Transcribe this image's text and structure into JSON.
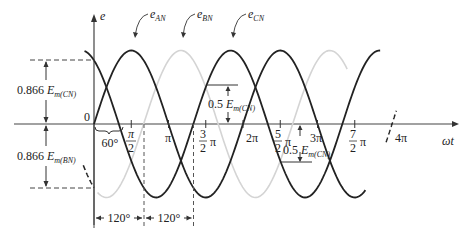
{
  "figure": {
    "y_axis_label": "e",
    "x_axis_label": "ωt",
    "origin_label": "0",
    "curve_labels": {
      "e_AN": {
        "main": "e",
        "sub": "AN"
      },
      "e_BN": {
        "main": "e",
        "sub": "BN"
      },
      "e_CN": {
        "main": "e",
        "sub": "CN"
      }
    },
    "x_ticks": [
      {
        "num": "π",
        "den": "2",
        "frac": true
      },
      {
        "label": "π"
      },
      {
        "num": "3",
        "den": "2",
        "suffix": "π",
        "frac": true
      },
      {
        "label": "2π"
      },
      {
        "num": "5",
        "den": "2",
        "suffix": "π",
        "frac": true
      },
      {
        "label": "3π"
      },
      {
        "num": "7",
        "den": "2",
        "suffix": "π",
        "frac": true
      },
      {
        "label": "4π"
      }
    ],
    "annotations": {
      "top_left": {
        "prefix": "0.866 ",
        "E": "E",
        "sub": "m(CN)"
      },
      "bottom_left": {
        "prefix": "0.866 ",
        "E": "E",
        "sub": "m(BN)"
      },
      "mid_upper": {
        "prefix": "0.5 ",
        "E": "E",
        "sub": "m(CN)"
      },
      "mid_lower": {
        "prefix": "0.5 ",
        "E": "E",
        "sub": "m(CN)"
      },
      "phase_angle": "60°",
      "spacing_1": "120°",
      "spacing_2": "120°"
    },
    "colors": {
      "e_AN": "#222222",
      "e_BN": "#d4d4d4",
      "e_CN": "#222222",
      "axis": "#444444"
    }
  },
  "chart_data": {
    "type": "line",
    "xlabel": "ωt",
    "ylabel": "e",
    "xlim_rad": [
      0,
      12.566
    ],
    "series": [
      {
        "name": "e_AN",
        "phase_deg": 0,
        "amplitude": 1.0,
        "color": "#222222"
      },
      {
        "name": "e_BN",
        "phase_deg": -120,
        "amplitude": 1.0,
        "color": "#d4d4d4"
      },
      {
        "name": "e_CN",
        "phase_deg": -240,
        "amplitude": 1.0,
        "color": "#222222"
      }
    ],
    "x_tick_labels": [
      "π/2",
      "π",
      "3/2π",
      "2π",
      "5/2π",
      "3π",
      "7/2π",
      "4π"
    ],
    "annotations": [
      "0.866 Em(CN)",
      "0.866 Em(BN)",
      "0.5 Em(CN)",
      "60°",
      "120°",
      "120°"
    ]
  }
}
